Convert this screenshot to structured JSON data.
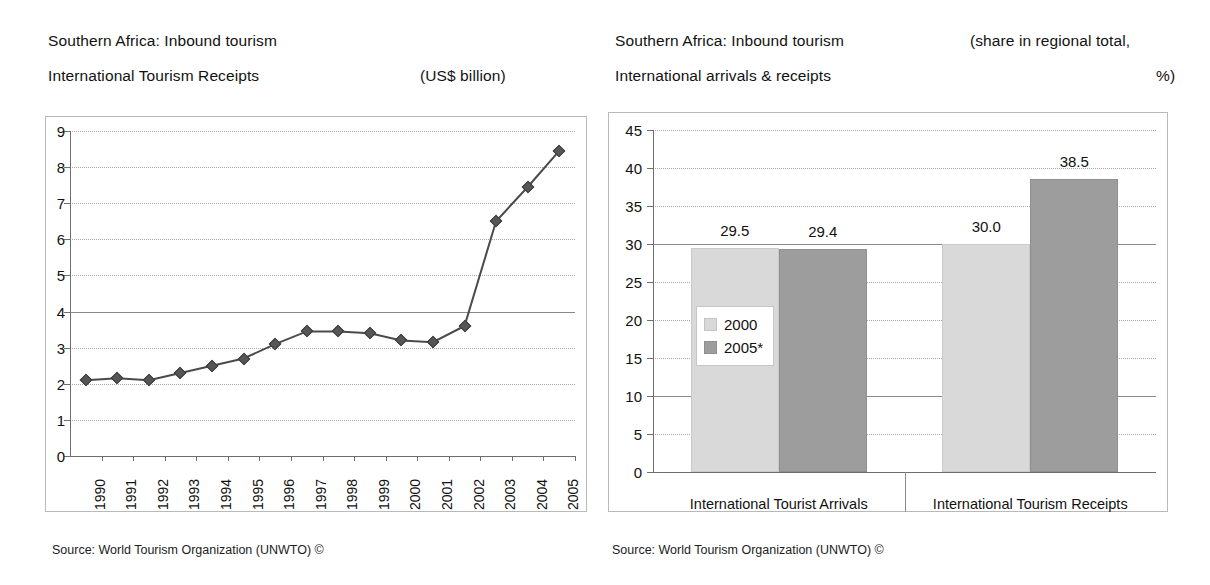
{
  "left_panel": {
    "title_line1": "Southern Africa: Inbound tourism",
    "title_line2": "International Tourism Receipts",
    "unit": "(US$ billion)",
    "source": "Source: World Tourism Organization (UNWTO) ©"
  },
  "right_panel": {
    "title_line1": "Southern Africa: Inbound tourism",
    "title_line2": "International arrivals & receipts",
    "unit_line1": "(share in regional total,",
    "unit_line2": "%)",
    "source": "Source: World Tourism Organization (UNWTO) ©"
  },
  "chart_data": [
    {
      "type": "line",
      "title": "Southern Africa: Inbound tourism — International Tourism Receipts",
      "xlabel": "",
      "ylabel": "(US$ billion)",
      "ylim": [
        0,
        9
      ],
      "yticks": [
        0,
        1,
        2,
        3,
        4,
        5,
        6,
        7,
        8,
        9
      ],
      "ytick_labels": [
        "0",
        "1",
        "2",
        "3",
        "4",
        "5",
        "6",
        "7",
        "8",
        "9"
      ],
      "grid": true,
      "legend": "none",
      "marker": "diamond",
      "x": [
        "1990",
        "1991",
        "1992",
        "1993",
        "1994",
        "1995",
        "1996",
        "1997",
        "1998",
        "1999",
        "2000",
        "2001",
        "2002",
        "2003",
        "2004",
        "2005"
      ],
      "values": [
        2.1,
        2.15,
        2.1,
        2.3,
        2.5,
        2.7,
        3.1,
        3.45,
        3.45,
        3.4,
        3.2,
        3.15,
        3.6,
        6.5,
        7.45,
        8.45
      ]
    },
    {
      "type": "bar",
      "title": "Southern Africa: Inbound tourism — International arrivals & receipts",
      "xlabel": "",
      "ylabel": "(share in regional total, %)",
      "ylim": [
        0,
        45
      ],
      "yticks": [
        0,
        5,
        10,
        15,
        20,
        25,
        30,
        35,
        40,
        45
      ],
      "ytick_labels": [
        "0",
        "5",
        "10",
        "15",
        "20",
        "25",
        "30",
        "35",
        "40",
        "45"
      ],
      "grid": true,
      "legend_position": "center-left-inside",
      "categories": [
        "International Tourist Arrivals",
        "International Tourism Receipts"
      ],
      "series": [
        {
          "name": "2000",
          "values": [
            29.5,
            30.0
          ],
          "labels": [
            "29.5",
            "30.0"
          ],
          "color": "#d9d9d9"
        },
        {
          "name": "2005*",
          "values": [
            29.4,
            38.5
          ],
          "labels": [
            "29.4",
            "38.5"
          ],
          "color": "#9d9d9d"
        }
      ]
    }
  ]
}
